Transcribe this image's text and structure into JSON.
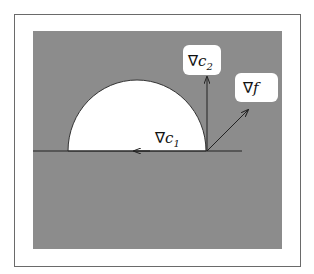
{
  "figure": {
    "frame": {
      "x": 14,
      "y": 14,
      "width": 286,
      "height": 252,
      "stroke": "#6a6a6a"
    },
    "infeasible_region": {
      "x": 33,
      "y": 31,
      "width": 249,
      "height": 218,
      "fill": "#8c8c8c"
    },
    "feasible_region": {
      "shape": "half-ellipse",
      "cx": 137,
      "cy": 151,
      "rx": 69,
      "ry": 71,
      "fill": "#ffffff"
    },
    "constraint_line": {
      "x1": 33,
      "y1": 151,
      "x2": 242,
      "y2": 151
    },
    "point": {
      "x": 207,
      "y": 151
    },
    "vectors": [
      {
        "name": "grad-c2",
        "x1": 207,
        "y1": 151,
        "x2": 207,
        "y2": 76
      },
      {
        "name": "grad-f",
        "x1": 207,
        "y1": 151,
        "x2": 248,
        "y2": 110
      },
      {
        "name": "grad-c1",
        "x1": 150,
        "y1": 151,
        "x2": 133,
        "y2": 151
      }
    ],
    "labels": {
      "grad_c2": {
        "nabla": "∇",
        "var": "c",
        "sub": "2"
      },
      "grad_f": {
        "nabla": "∇",
        "var": "f",
        "sub": ""
      },
      "grad_c1": {
        "nabla": "∇",
        "var": "c",
        "sub": "1"
      }
    }
  }
}
